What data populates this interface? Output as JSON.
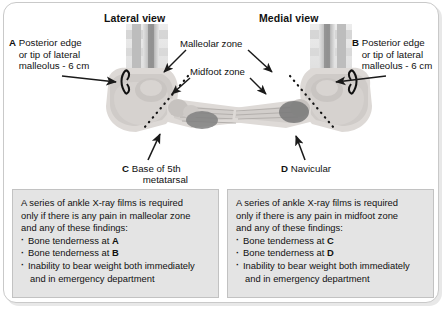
{
  "figure": {
    "headings": {
      "lateral": "Lateral view",
      "medial": "Medial view"
    },
    "callouts": {
      "a": {
        "tag": "A",
        "line1": "Posterior edge",
        "line2": "or tip of lateral",
        "line3": "malleolus - 6 cm"
      },
      "b": {
        "tag": "B",
        "line1": "Posterior edge",
        "line2": "or tip of lateral",
        "line3": "malleolus - 6 cm"
      },
      "c": {
        "tag": "C",
        "line1": "Base of 5th",
        "line2": "metatarsal"
      },
      "d": {
        "tag": "D",
        "line1": "Navicular",
        "line2": ""
      },
      "malleolar_zone": "Malleolar zone",
      "midfoot_zone": "Midfoot zone"
    },
    "criteria_left": {
      "intro_line1": "A series of ankle X-ray films is required",
      "intro_line2": "only if there is any pain in malleolar zone",
      "intro_line3": "and any of these findings:",
      "bullets": [
        {
          "text": "Bone tenderness at ",
          "bold": "A",
          "cont": ""
        },
        {
          "text": "Bone tenderness at ",
          "bold": "B",
          "cont": ""
        },
        {
          "text": "Inability to bear weight both immediately",
          "bold": "",
          "cont": "and in emergency department"
        }
      ]
    },
    "criteria_right": {
      "intro_line1": "A series of ankle X-ray films is required",
      "intro_line2": "only if there is any pain in midfoot zone",
      "intro_line3": "and any of these findings:",
      "bullets": [
        {
          "text": "Bone tenderness at ",
          "bold": "C",
          "cont": ""
        },
        {
          "text": "Bone tenderness at ",
          "bold": "D",
          "cont": ""
        },
        {
          "text": "Inability to bear weight both immediately",
          "bold": "",
          "cont": "and in emergency department"
        }
      ]
    },
    "colors": {
      "frame_border": "#c9c9c9",
      "box_background": "#e4e4e4",
      "box_border": "#c2c2c2",
      "text": "#111111",
      "bone_light": "#d9d9d9",
      "bone_mid": "#b9b9b9",
      "bone_dark": "#8f8f8f",
      "zone_marker": "#6f6f6f",
      "arrow": "#1a1a1a"
    }
  }
}
